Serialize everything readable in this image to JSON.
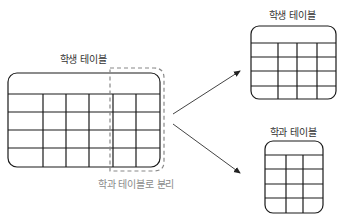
{
  "labels": {
    "source_table": "학생 테이블",
    "split_caption": "학과 테이블로 분리",
    "result_student_table": "학생 테이블",
    "result_department_table": "학과 테이블"
  },
  "colors": {
    "line": "#1a1a1a",
    "dashed": "#888888",
    "caption": "#8a8a8a",
    "arrow": "#444444"
  },
  "diagram": {
    "source_table": {
      "columns": 6,
      "data_rows": 4,
      "header_row": true
    },
    "split_region": {
      "columns_moved": 2
    },
    "result_student_table": {
      "columns": 4,
      "data_rows": 4,
      "header_row": true
    },
    "result_department_table": {
      "columns": 3,
      "data_rows": 4,
      "header_row": true
    },
    "arrows": 2
  }
}
